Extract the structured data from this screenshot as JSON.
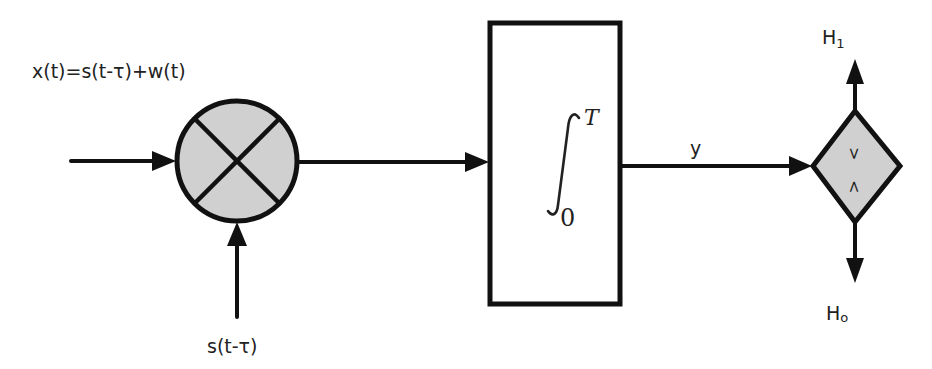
{
  "diagram": {
    "type": "block-diagram",
    "colors": {
      "stroke": "#111111",
      "block_fill": "#d0d0d0",
      "background": "#ffffff",
      "text": "#222222"
    },
    "labels": {
      "input_signal": "x(t)=s(t-τ)+w(t)",
      "reference_signal": "s(t-τ)",
      "output": "y",
      "hypothesis_1": "H",
      "hypothesis_1_sub": "1",
      "hypothesis_0": "H",
      "hypothesis_0_sub": "o"
    },
    "blocks": [
      {
        "id": "multiplier",
        "shape": "circle",
        "symbol": "×"
      },
      {
        "id": "integrator",
        "shape": "rectangle",
        "integral_symbol": "∫",
        "upper_limit": "T",
        "lower_limit": "0"
      },
      {
        "id": "comparator",
        "shape": "diamond",
        "symbol_top": ">",
        "symbol_bottom": "<"
      }
    ],
    "edges": [
      {
        "from": "input",
        "to": "multiplier"
      },
      {
        "from": "reference",
        "to": "multiplier"
      },
      {
        "from": "multiplier",
        "to": "integrator"
      },
      {
        "from": "integrator",
        "to": "comparator",
        "label": "y"
      },
      {
        "from": "comparator",
        "to": "H1"
      },
      {
        "from": "comparator",
        "to": "H0"
      }
    ]
  }
}
